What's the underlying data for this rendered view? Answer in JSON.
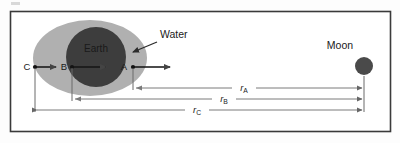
{
  "figure": {
    "background": "#fdfdfd",
    "frame_color": "#3a3a3a",
    "line_color": "#555555",
    "text_color": "#1a1a1a"
  },
  "bodies": {
    "earth": {
      "label": "Earth",
      "color": "#3d3d3d",
      "cx": 96,
      "cy": 57,
      "r": 30
    },
    "water": {
      "label": "Water",
      "color": "#b0b0b0",
      "cx": 90,
      "cy": 58,
      "rx": 57,
      "ry": 38
    },
    "moon": {
      "label": "Moon",
      "color": "#4a4a4a",
      "cx": 364,
      "cy": 66,
      "r": 9
    }
  },
  "points": [
    {
      "name": "C",
      "label": "C",
      "x": 35,
      "y": 67,
      "arrow_length": 22
    },
    {
      "name": "B",
      "label": "B",
      "x": 72,
      "y": 67,
      "arrow_length": 36
    },
    {
      "name": "A",
      "label": "A",
      "x": 133,
      "y": 67,
      "arrow_length": 39
    }
  ],
  "distances": [
    {
      "name": "r_A",
      "symbol": "r",
      "subscript": "A",
      "from": "A",
      "to": "Moon",
      "y": 88,
      "x_start": 133,
      "x_end": 364
    },
    {
      "name": "r_B",
      "symbol": "r",
      "subscript": "B",
      "from": "B",
      "to": "Moon",
      "y": 99,
      "x_start": 72,
      "x_end": 364
    },
    {
      "name": "r_C",
      "symbol": "r",
      "subscript": "C",
      "from": "C",
      "to": "Moon",
      "y": 110,
      "x_start": 35,
      "x_end": 364
    }
  ],
  "annotations": [
    {
      "name": "water-callout",
      "label": "Water",
      "text_x": 160,
      "text_y": 35,
      "arrow_from_x": 155,
      "arrow_from_y": 40,
      "arrow_to_x": 131,
      "arrow_to_y": 50
    }
  ],
  "frame": {
    "x": 10,
    "y": 11,
    "width": 381,
    "height": 121
  }
}
